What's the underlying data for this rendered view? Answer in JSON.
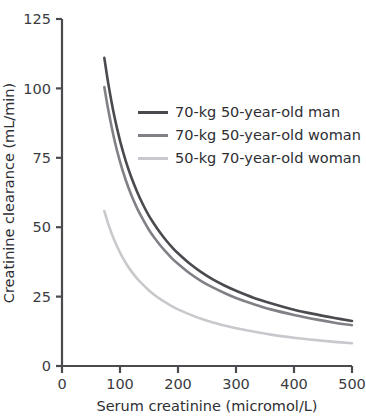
{
  "figure": {
    "title_remnant": "",
    "background": "#ffffff"
  },
  "chart_data": {
    "type": "line",
    "title": "",
    "xlabel": "Serum creatinine (micromol/L)",
    "ylabel": "Creatinine clearance (mL/min)",
    "xlim": [
      0,
      500
    ],
    "ylim": [
      0,
      125
    ],
    "xticks": [
      0,
      100,
      200,
      300,
      400,
      500
    ],
    "yticks": [
      0,
      25,
      50,
      75,
      100,
      125
    ],
    "xtick_labels": [
      "0",
      "100",
      "200",
      "300",
      "400",
      "500"
    ],
    "ytick_labels": [
      "0",
      "25",
      "50",
      "75",
      "100",
      "125"
    ],
    "grid": false,
    "legend_position": "upper right",
    "series": [
      {
        "name": "70-kg 50-year-old man",
        "color": "#4a4a4f",
        "x": [
          73,
          80,
          90,
          100,
          110,
          120,
          130,
          140,
          150,
          160,
          170,
          180,
          190,
          200,
          220,
          240,
          260,
          280,
          300,
          330,
          360,
          400,
          440,
          470,
          500
        ],
        "y": [
          111,
          101.5,
          90.2,
          81.2,
          73.8,
          67.7,
          62.5,
          58,
          54.1,
          50.8,
          47.8,
          45.1,
          42.7,
          40.6,
          36.9,
          33.8,
          31.2,
          29,
          27.1,
          24.6,
          22.6,
          20.3,
          18.5,
          17.3,
          16.2
        ]
      },
      {
        "name": "70-kg 50-year-old woman",
        "color": "#808087",
        "x": [
          73,
          80,
          90,
          100,
          110,
          120,
          130,
          140,
          150,
          160,
          170,
          180,
          190,
          200,
          220,
          240,
          260,
          280,
          300,
          330,
          360,
          400,
          440,
          470,
          500
        ],
        "y": [
          100.5,
          92,
          81.8,
          73.6,
          66.9,
          61.3,
          56.6,
          52.6,
          49,
          46,
          43.3,
          40.9,
          38.7,
          36.8,
          33.4,
          30.6,
          28.3,
          26.3,
          24.5,
          22.3,
          20.4,
          18.4,
          16.7,
          15.6,
          14.7
        ]
      },
      {
        "name": "50-kg 70-year-old woman",
        "color": "#c9c9cd",
        "x": [
          73,
          80,
          90,
          100,
          110,
          120,
          130,
          140,
          150,
          160,
          170,
          180,
          190,
          200,
          220,
          240,
          260,
          280,
          300,
          330,
          360,
          400,
          440,
          470,
          500
        ],
        "y": [
          55.8,
          51,
          45.4,
          40.9,
          37.1,
          34,
          31.4,
          29.2,
          27.2,
          25.5,
          24,
          22.7,
          21.5,
          20.4,
          18.6,
          17,
          15.7,
          14.6,
          13.6,
          12.4,
          11.3,
          10.2,
          9.3,
          8.7,
          8.2
        ]
      }
    ]
  },
  "legend": {
    "entries": [
      {
        "label": "70-kg 50-year-old man",
        "color": "#4a4a4f"
      },
      {
        "label": "70-kg 50-year-old woman",
        "color": "#808087"
      },
      {
        "label": "50-kg 70-year-old woman",
        "color": "#c9c9cd"
      }
    ]
  },
  "axes": {
    "x_title": "Serum creatinine (micromol/L)",
    "y_title": "Creatinine clearance (mL/min)",
    "x_labels": [
      "0",
      "100",
      "200",
      "300",
      "400",
      "500"
    ],
    "y_labels": [
      "0",
      "25",
      "50",
      "75",
      "100",
      "125"
    ]
  }
}
